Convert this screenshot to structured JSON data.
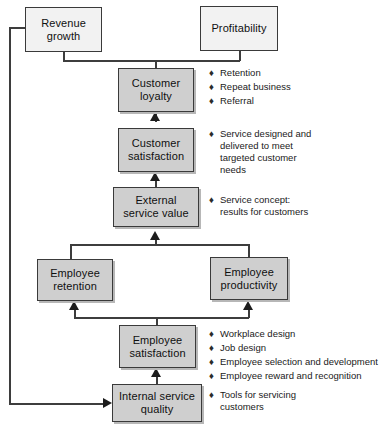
{
  "diagram": {
    "bullet_glyph": "♦"
  },
  "nodes": {
    "revenue_growth": "Revenue\ngrowth",
    "profitability": "Profitability",
    "customer_loyalty": "Customer\nloyalty",
    "customer_satisfaction": "Customer\nsatisfaction",
    "external_service_value": "External\nservice value",
    "employee_retention": "Employee\nretention",
    "employee_productivity": "Employee\nproductivity",
    "employee_satisfaction": "Employee\nsatisfaction",
    "internal_service_quality": "Internal service\nquality"
  },
  "annotations": {
    "customer_loyalty": [
      "Retention",
      "Repeat business",
      "Referral"
    ],
    "customer_satisfaction": [
      "Service designed and\ndelivered to meet\ntargeted customer\nneeds"
    ],
    "external_service_value": [
      "Service concept:\nresults for customers"
    ],
    "employee_satisfaction": [
      "Workplace design",
      "Job design",
      "Employee selection and development",
      "Employee reward and recognition"
    ],
    "internal_service_quality": [
      "Tools for servicing\ncustomers"
    ]
  },
  "colors": {
    "box_fill_light": "#f2f2f2",
    "box_fill_shaded": "#cfcfcf",
    "border": "#3a3a3a",
    "line": "#3d3d3d",
    "text": "#101010"
  }
}
